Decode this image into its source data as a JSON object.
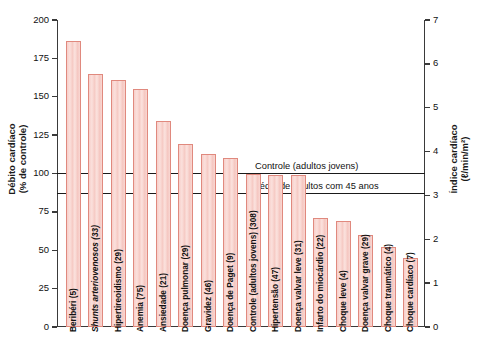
{
  "chart_data": {
    "type": "bar",
    "title": "",
    "categories": [
      "Beribéri (5)",
      "Shunts arteriovenosos (33)",
      "Hipertireoidismo (29)",
      "Anemia (75)",
      "Ansiedade (21)",
      "Doença pulmonar (29)",
      "Gravidez (46)",
      "Doença de Paget (9)",
      "Controle (adultos jovens) (308)",
      "Hipertensão (47)",
      "Doença valvar leve (31)",
      "Infarto do miocárdio (22)",
      "Choque leve (4)",
      "Doença valvar grave (29)",
      "Choque traumático (4)",
      "Choque cardíaco (7)"
    ],
    "values": [
      186,
      165,
      161,
      155,
      134,
      119,
      113,
      110,
      100,
      99,
      99,
      71,
      69,
      60,
      52,
      45
    ],
    "italic_categories": [
      "Shunts arteriovenosos (33)"
    ],
    "xlabel": "",
    "ylabel": "Débito cardíaco\n(% de controle)",
    "ylabel_left_line1": "Débito cardíaco",
    "ylabel_left_line2": "(% de controle)",
    "ylabel_right_line1": "Índice cardíaco",
    "ylabel_right_line2": "(ℓ/min/m²)",
    "ylim": [
      0,
      200
    ],
    "yticks": [
      0,
      25,
      50,
      75,
      100,
      125,
      150,
      175,
      200
    ],
    "yticklabels": [
      "0",
      "25",
      "50",
      "75",
      "100",
      "125",
      "150",
      "175",
      "200"
    ],
    "y2lim": [
      0,
      7
    ],
    "y2ticks": [
      0,
      1,
      2,
      3,
      4,
      5,
      6,
      7
    ],
    "y2ticklabels": [
      "0",
      "1",
      "2",
      "3",
      "4",
      "5",
      "6",
      "7"
    ],
    "grid": false,
    "legend": "none",
    "annotations": [
      {
        "label": "Controle (adultos jovens)",
        "y": 100
      },
      {
        "label": "Média de adultos com 45 anos",
        "y": 87
      }
    ],
    "bar_fill_color": "#f8d5d0",
    "bar_edge_color": "#e0897e",
    "axis_color": "#3a3a3a"
  }
}
